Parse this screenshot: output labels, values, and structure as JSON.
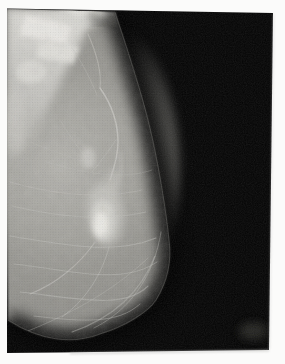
{
  "image": {
    "kind": "mammogram-xray-film-photo",
    "regions": [
      "film-margin",
      "film-background",
      "breast-tissue",
      "pectoral-dense-region",
      "dense-bright-patches",
      "top-dense-blob",
      "blood-vessel",
      "fibrous-strands",
      "dense-mass",
      "film-artifact-blob",
      "film-edge-shadow"
    ]
  },
  "colors": {
    "page_bg": "#fbfbfa",
    "film_black": "#050505",
    "tissue_base": "#92918c",
    "tissue_bright": "#d6d5d0",
    "mass_bright": "#eeede8",
    "strand_light": "#c6c5c0",
    "edge_shadow": "#c2c2c0",
    "artifact_gray": "#292928"
  }
}
